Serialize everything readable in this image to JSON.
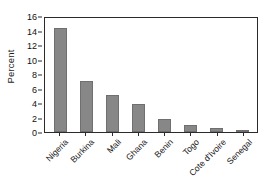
{
  "chart_data": {
    "type": "bar",
    "title": "",
    "xlabel": "",
    "ylabel": "Percent",
    "categories": [
      "Nigeria",
      "Burkina",
      "Mali",
      "Ghana",
      "Benin",
      "Togo",
      "Cote d'Ivoire",
      "Senegal"
    ],
    "values": [
      14.4,
      7.1,
      5.1,
      3.8,
      1.85,
      1.0,
      0.55,
      0.07
    ],
    "ylim": [
      0,
      16
    ],
    "yticks": [
      0,
      2,
      4,
      6,
      8,
      10,
      12,
      14,
      16
    ],
    "ytick_labels": [
      "0",
      "2",
      "4",
      "6",
      "8",
      "10",
      "12",
      "14",
      "16"
    ],
    "grid": false,
    "legend": null,
    "bar_color": "#878787",
    "axis_color": "#2b2b2b",
    "background": "#ffffff"
  }
}
